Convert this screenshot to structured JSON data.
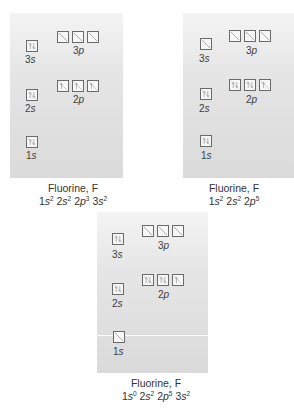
{
  "colors": {
    "background": "#ffffff",
    "panel_top": "#f4f4f4",
    "panel_bottom": "#dadada",
    "box_border": "#6a6a6a",
    "text": "#333333"
  },
  "diagrams": [
    {
      "id": "left",
      "title": "Fluorine, F",
      "config": [
        {
          "orbital": "1s",
          "exp": "2"
        },
        {
          "orbital": "2s",
          "exp": "2"
        },
        {
          "orbital": "2p",
          "exp": "3"
        },
        {
          "orbital": "3s",
          "exp": "2"
        }
      ],
      "labels": {
        "s3": "3s",
        "p3": "3p",
        "s2": "2s",
        "p2": "2p",
        "s1": "1s"
      },
      "boxes": {
        "s3": "paired",
        "p3": [
          "empty",
          "empty",
          "empty"
        ],
        "s2": "paired",
        "p2": [
          "up",
          "up",
          "up"
        ],
        "s1": "paired"
      }
    },
    {
      "id": "right",
      "title": "Fluorine, F",
      "config": [
        {
          "orbital": "1s",
          "exp": "2"
        },
        {
          "orbital": "2s",
          "exp": "2"
        },
        {
          "orbital": "2p",
          "exp": "5"
        }
      ],
      "labels": {
        "s3": "3s",
        "p3": "3p",
        "s2": "2s",
        "p2": "2p",
        "s1": "1s"
      },
      "boxes": {
        "s3": "empty",
        "p3": [
          "empty",
          "empty",
          "empty"
        ],
        "s2": "paired",
        "p2": [
          "paired",
          "paired",
          "up"
        ],
        "s1": "paired"
      }
    },
    {
      "id": "bottom",
      "title": "Fluorine, F",
      "config": [
        {
          "orbital": "1s",
          "exp": "0"
        },
        {
          "orbital": "2s",
          "exp": "2"
        },
        {
          "orbital": "2p",
          "exp": "5"
        },
        {
          "orbital": "3s",
          "exp": "2"
        }
      ],
      "labels": {
        "s3": "3s",
        "p3": "3p",
        "s2": "2s",
        "p2": "2p",
        "s1": "1s"
      },
      "boxes": {
        "s3": "paired",
        "p3": [
          "empty",
          "empty",
          "empty"
        ],
        "s2": "paired",
        "p2": [
          "paired",
          "paired",
          "up"
        ],
        "s1": "empty"
      }
    }
  ]
}
